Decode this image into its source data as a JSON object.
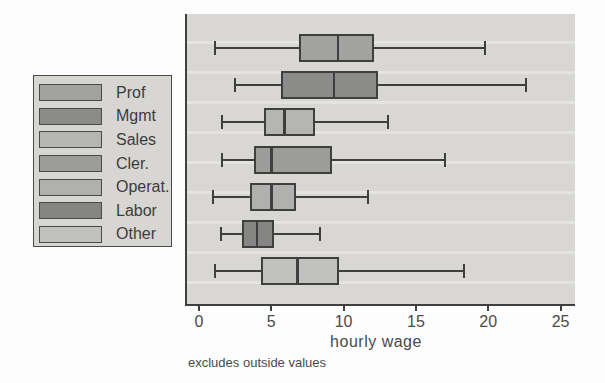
{
  "chart_data": {
    "type": "box",
    "orientation": "horizontal",
    "title": "",
    "xlabel": "hourly wage",
    "note": "excludes outside values",
    "x_ticks": [
      0,
      5,
      10,
      15,
      20,
      25
    ],
    "xlim": [
      -0.9,
      26.0
    ],
    "legend_position": "left",
    "categories": [
      "Prof",
      "Mgmt",
      "Sales",
      "Cler.",
      "Operat.",
      "Labor",
      "Other"
    ],
    "series": [
      {
        "label": "Prof",
        "lower_whisker": 1.1,
        "q1": 6.9,
        "median": 9.6,
        "q3": 12.1,
        "upper_whisker": 19.8,
        "color": "#a2a2a0"
      },
      {
        "label": "Mgmt",
        "lower_whisker": 2.5,
        "q1": 5.7,
        "median": 9.3,
        "q3": 12.4,
        "upper_whisker": 22.6,
        "color": "#8b8b89"
      },
      {
        "label": "Sales",
        "lower_whisker": 1.6,
        "q1": 4.5,
        "median": 5.9,
        "q3": 8.0,
        "upper_whisker": 13.1,
        "color": "#b5b5b2"
      },
      {
        "label": "Cler.",
        "lower_whisker": 1.6,
        "q1": 3.8,
        "median": 5.0,
        "q3": 9.2,
        "upper_whisker": 17.0,
        "color": "#9c9c9a"
      },
      {
        "label": "Operat.",
        "lower_whisker": 1.0,
        "q1": 3.5,
        "median": 5.0,
        "q3": 6.7,
        "upper_whisker": 11.7,
        "color": "#b0b0ae"
      },
      {
        "label": "Labor",
        "lower_whisker": 1.5,
        "q1": 3.0,
        "median": 4.0,
        "q3": 5.2,
        "upper_whisker": 8.4,
        "color": "#858583"
      },
      {
        "label": "Other",
        "lower_whisker": 1.1,
        "q1": 4.3,
        "median": 6.8,
        "q3": 9.7,
        "upper_whisker": 18.3,
        "color": "#c1c1bf"
      }
    ]
  },
  "style": {
    "page_bg": "#fdfdfd",
    "plot_bg": "#d8d7d3",
    "legend_bg": "#d7d6d2",
    "line_color": "#3f3f3f",
    "text_color": "#4a4a4a"
  }
}
